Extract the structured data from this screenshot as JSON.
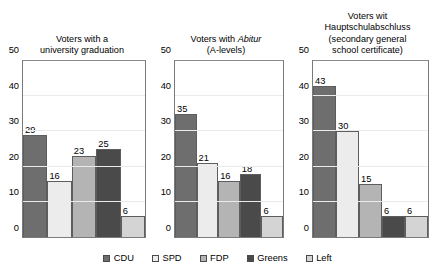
{
  "chart_data": {
    "type": "bar",
    "title": "",
    "xlabel": "",
    "ylabel": "",
    "ylim": [
      0,
      50
    ],
    "yticks": [
      0,
      10,
      20,
      30,
      40,
      50
    ],
    "grid": true,
    "legend_position": "bottom-center",
    "categories": [
      "CDU",
      "SPD",
      "FDP",
      "Greens",
      "Left"
    ],
    "series_colors": [
      "#6e6e6e",
      "#ececec",
      "#b4b4b4",
      "#4a4a4a",
      "#d4d4d4"
    ],
    "panels": [
      {
        "title_lines": [
          "Voters with a",
          "university graduation"
        ],
        "values": [
          29,
          16,
          23,
          25,
          6
        ]
      },
      {
        "title_lines": [
          "Voters with Abitur",
          "(A-levels)"
        ],
        "title_italic_word": "Abitur",
        "values": [
          35,
          21,
          16,
          18,
          6
        ]
      },
      {
        "title_lines": [
          "Voters wit",
          "Hauptschulabschluss",
          "(secondary general",
          "school certificate)"
        ],
        "values": [
          43,
          30,
          15,
          6,
          6
        ]
      }
    ],
    "legend": [
      {
        "label": "CDU",
        "color": "#6e6e6e"
      },
      {
        "label": "SPD",
        "color": "#ececec"
      },
      {
        "label": "FDP",
        "color": "#b4b4b4"
      },
      {
        "label": "Greens",
        "color": "#4a4a4a"
      },
      {
        "label": "Left",
        "color": "#d4d4d4"
      }
    ]
  }
}
